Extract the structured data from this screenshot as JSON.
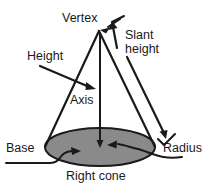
{
  "figure": {
    "caption": "Right cone",
    "background_color": "#ffffff",
    "stroke_color": "#1a1a1a",
    "base_fill_color": "#8a8a8a",
    "labels": {
      "vertex": "Vertex",
      "slant_height_line1": "Slant",
      "slant_height_line2": "height",
      "height": "Height",
      "axis": "Axis",
      "base": "Base",
      "radius": "Radius"
    },
    "icons": {
      "vertex_pointer": "arrow-up-right-icon",
      "slant_pointer": "arrow-up-icon",
      "slant_end_tick": "tick-mark-icon",
      "height_pointer": "arrow-down-right-icon",
      "base_pointer": "curved-arrow-right-icon",
      "radius_pointer": "curved-arrow-left-icon"
    }
  }
}
